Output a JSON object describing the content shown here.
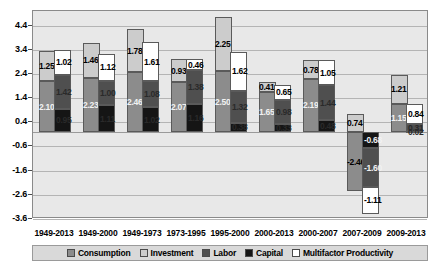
{
  "chart_data": {
    "type": "bar",
    "title": "",
    "subtitle": "",
    "xlabel": "",
    "ylabel": "",
    "ylim": [
      -3.6,
      5.0
    ],
    "yticks": [
      4.4,
      3.4,
      2.4,
      1.4,
      0.4,
      -0.6,
      -1.6,
      -2.6,
      -3.6
    ],
    "ytick_labels": [
      "4.4",
      "3.4",
      "2.4",
      "1.4",
      "0.4",
      "-0.6",
      "-1.6",
      "-2.6",
      "-3.6"
    ],
    "grid": true,
    "legend_position": "bottom",
    "stacked": true,
    "bars_per_group": 2,
    "bar1_stack": [
      "Consumption",
      "Investment"
    ],
    "bar2_stack": [
      "Capital",
      "Labor",
      "Multifactor Productivity"
    ],
    "categories": [
      "1949-2013",
      "1949-2000",
      "1949-1973",
      "1973-1995",
      "1995-2000",
      "2000-2013",
      "2000-2007",
      "2007-2009",
      "2009-2013"
    ],
    "series": [
      {
        "name": "Consumption",
        "color": "#8c8c8c",
        "values": [
          2.1,
          2.23,
          2.46,
          2.07,
          2.5,
          1.65,
          2.19,
          -2.46,
          1.15
        ]
      },
      {
        "name": "Investment",
        "color": "#cccccc",
        "values": [
          1.25,
          1.46,
          1.78,
          0.93,
          2.25,
          0.41,
          0.78,
          0.74,
          1.21
        ]
      },
      {
        "name": "Labor",
        "color": "#4f4f4f",
        "values": [
          1.42,
          1.0,
          1.08,
          1.38,
          1.32,
          0.98,
          1.44,
          -1.6,
          0.31
        ]
      },
      {
        "name": "Capital",
        "color": "#151515",
        "values": [
          0.95,
          1.11,
          1.02,
          1.16,
          0.38,
          0.33,
          0.48,
          -0.68,
          0.02
        ]
      },
      {
        "name": "Multifactor Productivity",
        "color": "#ffffff",
        "values": [
          1.02,
          1.12,
          1.61,
          0.46,
          1.62,
          0.65,
          1.05,
          -1.11,
          0.84
        ]
      }
    ],
    "data_labels": [
      {
        "group": "1949-2013",
        "series": "Investment",
        "text": "1.25"
      },
      {
        "group": "1949-2013",
        "series": "Multifactor Productivity",
        "text": "1.02"
      },
      {
        "group": "1949-2013",
        "series": "Consumption",
        "text": "2.10"
      },
      {
        "group": "1949-2013",
        "series": "Labor",
        "text": "1.42"
      },
      {
        "group": "1949-2013",
        "series": "Capital",
        "text": "0.95"
      },
      {
        "group": "1949-2000",
        "series": "Investment",
        "text": "1.46"
      },
      {
        "group": "1949-2000",
        "series": "Multifactor Productivity",
        "text": "1.12"
      },
      {
        "group": "1949-2000",
        "series": "Consumption",
        "text": "2.23"
      },
      {
        "group": "1949-2000",
        "series": "Labor",
        "text": "1.00"
      },
      {
        "group": "1949-2000",
        "series": "Capital",
        "text": "1.11"
      },
      {
        "group": "1949-1973",
        "series": "Investment",
        "text": "1.78"
      },
      {
        "group": "1949-1973",
        "series": "Multifactor Productivity",
        "text": "1.61"
      },
      {
        "group": "1949-1973",
        "series": "Consumption",
        "text": "2.46"
      },
      {
        "group": "1949-1973",
        "series": "Labor",
        "text": "1.08"
      },
      {
        "group": "1949-1973",
        "series": "Capital",
        "text": "1.02"
      },
      {
        "group": "1973-1995",
        "series": "Investment",
        "text": "0.93"
      },
      {
        "group": "1973-1995",
        "series": "Multifactor Productivity",
        "text": "0.46"
      },
      {
        "group": "1973-1995",
        "series": "Consumption",
        "text": "2.07"
      },
      {
        "group": "1973-1995",
        "series": "Labor",
        "text": "1.38"
      },
      {
        "group": "1973-1995",
        "series": "Capital",
        "text": "1.16"
      },
      {
        "group": "1995-2000",
        "series": "Investment",
        "text": "2.25"
      },
      {
        "group": "1995-2000",
        "series": "Multifactor Productivity",
        "text": "1.62"
      },
      {
        "group": "1995-2000",
        "series": "Consumption",
        "text": "2.50"
      },
      {
        "group": "1995-2000",
        "series": "Labor",
        "text": "1.32"
      },
      {
        "group": "1995-2000",
        "series": "Capital",
        "text": "0.38"
      },
      {
        "group": "2000-2013",
        "series": "Investment",
        "text": "0.41"
      },
      {
        "group": "2000-2013",
        "series": "Multifactor Productivity",
        "text": "0.65"
      },
      {
        "group": "2000-2013",
        "series": "Consumption",
        "text": "1.65"
      },
      {
        "group": "2000-2013",
        "series": "Labor",
        "text": "0.98"
      },
      {
        "group": "2000-2013",
        "series": "Capital",
        "text": "0.33"
      },
      {
        "group": "2000-2007",
        "series": "Investment",
        "text": "0.78"
      },
      {
        "group": "2000-2007",
        "series": "Multifactor Productivity",
        "text": "1.05"
      },
      {
        "group": "2000-2007",
        "series": "Consumption",
        "text": "2.19"
      },
      {
        "group": "2000-2007",
        "series": "Labor",
        "text": "1.44"
      },
      {
        "group": "2000-2007",
        "series": "Capital",
        "text": "0.48"
      },
      {
        "group": "2007-2009",
        "series": "Investment",
        "text": "0.74"
      },
      {
        "group": "2007-2009",
        "series": "Multifactor Productivity",
        "text": "-1.11"
      },
      {
        "group": "2007-2009",
        "series": "Consumption",
        "text": "-2.46"
      },
      {
        "group": "2007-2009",
        "series": "Labor",
        "text": "-1.60"
      },
      {
        "group": "2007-2009",
        "series": "Capital",
        "text": "-0.68"
      },
      {
        "group": "2009-2013",
        "series": "Investment",
        "text": "1.21"
      },
      {
        "group": "2009-2013",
        "series": "Multifactor Productivity",
        "text": "0.84"
      },
      {
        "group": "2009-2013",
        "series": "Consumption",
        "text": "1.15"
      },
      {
        "group": "2009-2013",
        "series": "Labor",
        "text": "0.31"
      },
      {
        "group": "2009-2013",
        "series": "Capital",
        "text": "0.02"
      }
    ],
    "legend": [
      {
        "label": "Consumption",
        "color": "#8c8c8c"
      },
      {
        "label": "Investment",
        "color": "#cccccc"
      },
      {
        "label": "Labor",
        "color": "#4f4f4f"
      },
      {
        "label": "Capital",
        "color": "#151515"
      },
      {
        "label": "Multifactor Productivity",
        "color": "#ffffff"
      }
    ]
  },
  "colors": {
    "plot_background": "#e8e8e8",
    "page_background": "#ffffff",
    "gridline": "#b4b4b4",
    "axis": "#4a4a4a",
    "legend_background": "#d9d9d9"
  }
}
